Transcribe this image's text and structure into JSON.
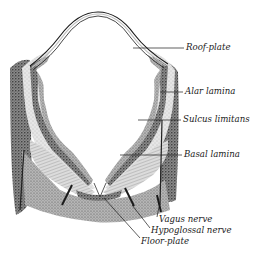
{
  "figure": {
    "colors": {
      "ink": "#1a1a1a",
      "background": "#ffffff",
      "stipple_dark": "#555555",
      "stipple_light": "#bdbdbd"
    },
    "labels": [
      {
        "id": "roof-plate",
        "text": "Roof-plate",
        "x": 186,
        "y": 45
      },
      {
        "id": "alar-lamina",
        "text": "Alar lamina",
        "x": 185,
        "y": 89
      },
      {
        "id": "sulcus-limitans",
        "text": "Sulcus limitans",
        "x": 183,
        "y": 116
      },
      {
        "id": "basal-lamina",
        "text": "Basal lamina",
        "x": 184,
        "y": 151
      },
      {
        "id": "vagus-nerve",
        "text": "Vagus nerve",
        "x": 159,
        "y": 217
      },
      {
        "id": "hypoglossal-nerve",
        "text": "Hypoglossal nerve",
        "x": 151,
        "y": 228
      },
      {
        "id": "floor-plate",
        "text": "Floor-plate",
        "x": 141,
        "y": 239
      }
    ]
  }
}
